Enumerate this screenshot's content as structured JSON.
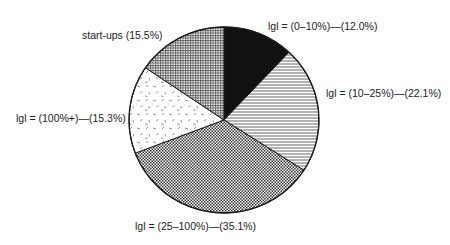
{
  "chart_data": {
    "type": "pie",
    "title": "",
    "start_angle": "12 o'clock",
    "direction": "clockwise",
    "slices": [
      {
        "label": "|g| = (0–10%)",
        "value": 12.0,
        "pattern": "solid-black",
        "display": "lgl = (0–10%)—(12.0%)"
      },
      {
        "label": "|g| = (10–25%)",
        "value": 22.1,
        "pattern": "horizontal-lines",
        "display": "lgl = (10–25%)—(22.1%)"
      },
      {
        "label": "|g| = (25–100%)",
        "value": 35.1,
        "pattern": "dots",
        "display": "lgl = (25–100%)—(35.1%)"
      },
      {
        "label": "|g| = (100%+)",
        "value": 15.3,
        "pattern": "dashes",
        "display": "lgl = (100%+)—(15.3%)"
      },
      {
        "label": "start-ups",
        "value": 15.5,
        "pattern": "crosshatch",
        "display": "start-ups (15.5%)"
      }
    ],
    "legend": "none (direct labels)"
  },
  "labels": {
    "slice0": "lgl = (0–10%)—(12.0%)",
    "slice1": "lgl = (10–25%)—(22.1%)",
    "slice2": "lgl = (25–100%)—(35.1%)",
    "slice3": "lgl = (100%+)—(15.3%)",
    "slice4": "start-ups (15.5%)"
  },
  "colors": {
    "outline": "#1a1a1a",
    "fill_dark": "#111111",
    "pattern_gray": "#555555",
    "background": "#ffffff"
  }
}
